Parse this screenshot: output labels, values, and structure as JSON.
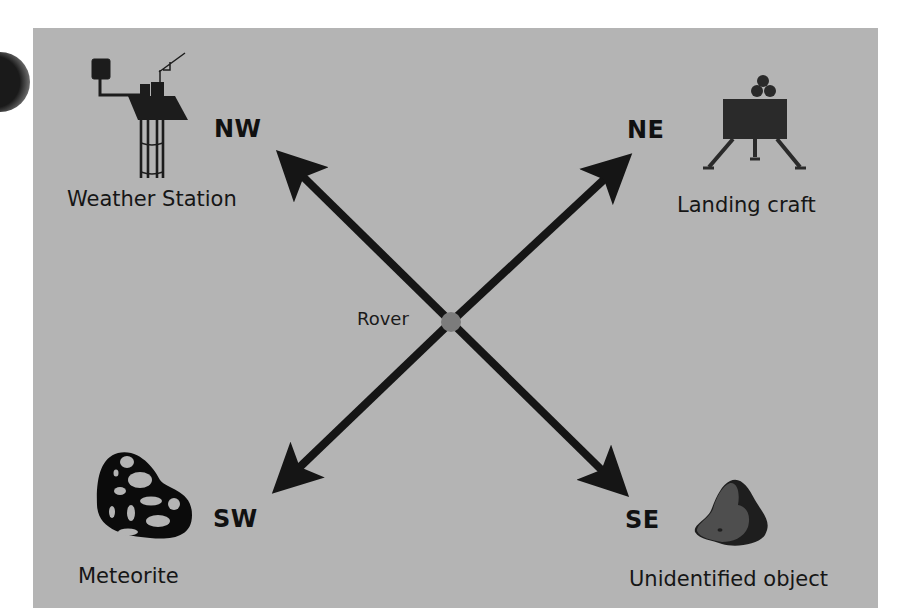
{
  "diagram": {
    "center": {
      "label": "Rover",
      "marker_color": "#7c7c7c"
    },
    "background_color": "#b4b4b4",
    "arrow_color": "#151515",
    "directions": [
      {
        "code": "NW",
        "target": "Weather Station",
        "icon": "weather-station-icon"
      },
      {
        "code": "NE",
        "target": "Landing craft",
        "icon": "landing-craft-icon"
      },
      {
        "code": "SW",
        "target": "Meteorite",
        "icon": "meteorite-icon"
      },
      {
        "code": "SE",
        "target": "Unidentified object",
        "icon": "unidentified-object-icon"
      }
    ]
  }
}
